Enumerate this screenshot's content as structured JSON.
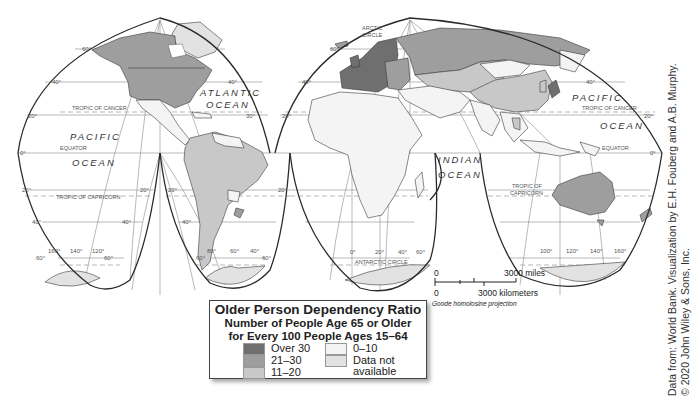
{
  "legend": {
    "title": "Older Person Dependency Ratio",
    "subtitle_line1": "Number of People Age 65 or Older",
    "subtitle_line2": "for Every 100 People Ages 15–64",
    "classes": [
      {
        "label": "Over 30",
        "color": "#6f6f6f"
      },
      {
        "label": "21–30",
        "color": "#9e9e9e"
      },
      {
        "label": "11–20",
        "color": "#c8c8c8"
      },
      {
        "label": "0–10",
        "color": "#f4f4f4"
      },
      {
        "label": "Data not",
        "label2": "available",
        "color": "#e2e2e2"
      }
    ]
  },
  "map": {
    "projection": "Goode homolosine projection",
    "oceans": {
      "atlantic_1": "ATLANTIC",
      "atlantic_2": "OCEAN",
      "pacific_w_1": "PACIFIC",
      "pacific_w_2": "OCEAN",
      "indian_1": "INDIAN",
      "indian_2": "OCEAN",
      "pacific_e_1": "PACIFIC",
      "pacific_e_2": "OCEAN"
    },
    "lines": {
      "tropic_cancer_w": "TROPIC OF CANCER",
      "tropic_cancer_e": "TROPIC OF CANCER",
      "equator_w": "EQUATOR",
      "equator_e": "EQUATOR",
      "tropic_capricorn_w": "TROPIC OF CAPRICORN",
      "tropic_capricorn_e1": "TROPIC OF",
      "tropic_capricorn_e2": "CAPRICORN",
      "arctic_1": "ARCTIC",
      "arctic_2": "CIRCLE",
      "antarctic": "ANTARCTIC CIRCLE"
    },
    "degree_labels": {
      "lat_60": "60°",
      "lat_40": "40°",
      "lat_20": "20°",
      "lat_0": "0°",
      "lat_s20": "20°",
      "lat_s40": "40°",
      "lat_s60": "60°",
      "lon_160": "160°",
      "lon_140": "140°",
      "lon_120": "120°",
      "lon_80": "80°",
      "lon_60": "60°",
      "lon_40": "40°",
      "lon_0": "0°",
      "lon_20": "20°",
      "lon_40e": "40°",
      "lon_60e": "60°",
      "lon_100": "100°",
      "lon_120e": "120°",
      "lon_140e": "140°",
      "lon_160e": "160°",
      "lat_30": "30°"
    }
  },
  "scale_bar": {
    "miles_zero": "0",
    "miles_label": "3000 miles",
    "km_zero": "0",
    "km_label": "3000 kilometers"
  },
  "credit": {
    "line1": "Data from: World Bank. Visualization by E.H. Fouberg and A.B. Murphy.",
    "line2": "© 2020 John Wiley & Sons, Inc."
  }
}
